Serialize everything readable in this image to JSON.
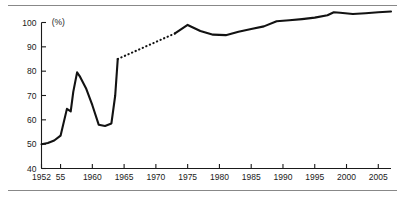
{
  "figure": {
    "unit_label": "(%)",
    "rules": {
      "top": "divider-top",
      "bottom": "divider-bottom"
    }
  },
  "chart_data": {
    "type": "line",
    "title": "",
    "subtitle": "",
    "xlabel": "",
    "ylabel": "(%)",
    "unit": "%",
    "grid": false,
    "legend": "none",
    "xlim": [
      1952,
      2007
    ],
    "ylim": [
      40,
      100
    ],
    "yticks": [
      40,
      50,
      60,
      70,
      80,
      90,
      100
    ],
    "ytick_labels": [
      "40",
      "50",
      "60",
      "70",
      "80",
      "90",
      "100"
    ],
    "xticks": [
      1952,
      1955,
      1960,
      1965,
      1970,
      1975,
      1980,
      1985,
      1990,
      1995,
      2000,
      2005
    ],
    "xtick_labels": [
      "1952",
      "55",
      "1960",
      "1965",
      "1970",
      "1975",
      "1980",
      "1985",
      "1990",
      "1995",
      "2000",
      "2005"
    ],
    "series": [
      {
        "name": "solid-early",
        "style": "solid",
        "x": [
          1952,
          1953,
          1954,
          1955,
          1956,
          1956.6,
          1957,
          1957.6,
          1958,
          1959,
          1960,
          1961,
          1962,
          1963,
          1963.6,
          1964
        ],
        "values": [
          50.0,
          50.5,
          51.5,
          53.5,
          64.5,
          63.5,
          71.5,
          79.5,
          78.0,
          73.0,
          66.0,
          58.0,
          57.5,
          58.5,
          70.0,
          85.0
        ]
      },
      {
        "name": "dotted-interpolated",
        "style": "dotted",
        "x": [
          1964,
          1973
        ],
        "values": [
          85.0,
          95.5
        ]
      },
      {
        "name": "solid-late",
        "style": "solid",
        "x": [
          1973,
          1975,
          1977,
          1979,
          1981,
          1983,
          1985,
          1987,
          1989,
          1991,
          1993,
          1995,
          1997,
          1998,
          1999,
          2001,
          2003,
          2005,
          2007
        ],
        "values": [
          95.5,
          99.0,
          96.5,
          95.0,
          94.8,
          96.2,
          97.3,
          98.4,
          100.5,
          100.9,
          101.4,
          102.0,
          103.0,
          104.2,
          104.0,
          103.5,
          103.8,
          104.2,
          104.5
        ]
      }
    ],
    "annotations": [
      {
        "text": "(%)",
        "x": 1953.6,
        "y": 99.0,
        "name": "unit-annotation"
      }
    ]
  }
}
